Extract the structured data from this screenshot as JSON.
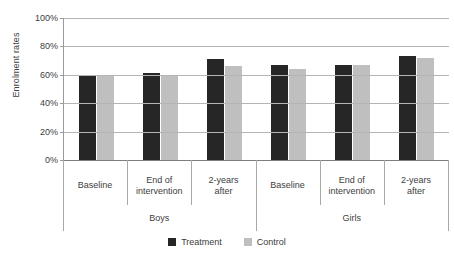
{
  "chart_data": {
    "type": "bar",
    "title": "",
    "xlabel": "",
    "ylabel": "Enrolment rates",
    "ylim": [
      0,
      100
    ],
    "ytick_labels": [
      "100%",
      "80%",
      "60%",
      "40%",
      "20%",
      "0%"
    ],
    "ytick_values": [
      100,
      80,
      60,
      40,
      20,
      0
    ],
    "grid": true,
    "legend_position": "bottom",
    "group_labels": [
      "Boys",
      "Girls"
    ],
    "categories": [
      "Baseline",
      "End of intervention",
      "2-years after",
      "Baseline",
      "End of intervention",
      "2-years after"
    ],
    "category_lines": [
      [
        "Baseline"
      ],
      [
        "End of",
        "intervention"
      ],
      [
        "2-years",
        "after"
      ],
      [
        "Baseline"
      ],
      [
        "End of",
        "intervention"
      ],
      [
        "2-years",
        "after"
      ]
    ],
    "series": [
      {
        "name": "Treatment",
        "color": "#262626",
        "values": [
          60,
          61,
          71,
          67,
          67,
          73
        ]
      },
      {
        "name": "Control",
        "color": "#bfbfbf",
        "values": [
          59,
          60,
          66,
          64,
          67,
          72
        ]
      }
    ]
  },
  "legend": {
    "items": [
      {
        "label": "Treatment",
        "color": "#262626"
      },
      {
        "label": "Control",
        "color": "#bfbfbf"
      }
    ]
  },
  "colors": {
    "treatment": "#262626",
    "control": "#bfbfbf",
    "gridline": "#b4b4b4",
    "axis": "#7d7d7d",
    "text": "#404040",
    "background": "#ffffff"
  }
}
